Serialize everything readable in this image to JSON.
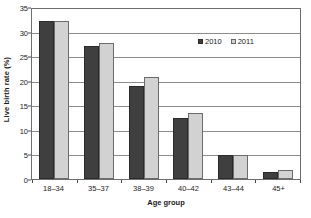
{
  "chart_data": {
    "type": "bar",
    "title": "",
    "subtitle": "",
    "xlabel": "Age group",
    "ylabel": "Live birth rate (%)",
    "categories": [
      "18–34",
      "35–37",
      "38–39",
      "40–42",
      "43–44",
      "45+"
    ],
    "series": [
      {
        "name": "2010",
        "color": "#3f3f3f",
        "values": [
          32.2,
          27.0,
          19.0,
          12.5,
          4.9,
          1.4
        ]
      },
      {
        "name": "2011",
        "color": "#d2d2d2",
        "values": [
          32.2,
          27.7,
          20.8,
          13.5,
          4.9,
          1.9
        ]
      }
    ],
    "ylim": [
      0,
      35
    ],
    "ytick_values": [
      0,
      5,
      10,
      15,
      20,
      25,
      30,
      35
    ],
    "ytick_labels": [
      "0",
      "5",
      "10",
      "15",
      "20",
      "25",
      "30",
      "35"
    ],
    "grid": "horizontal",
    "legend_position": "inside-top-right",
    "legend": [
      "2010",
      "2011"
    ],
    "annotations": []
  },
  "legend": {
    "entries": [
      {
        "label": "2010",
        "swatch": "filled-dark-square"
      },
      {
        "label": "2011",
        "swatch": "outlined-light-square"
      }
    ]
  },
  "axes": {
    "y_title": "Live birth rate (%)",
    "x_title": "Age group"
  }
}
